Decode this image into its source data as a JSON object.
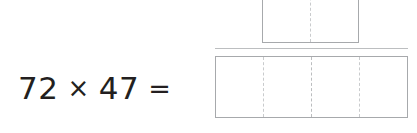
{
  "problem": {
    "first_factor": "72",
    "operator": "×",
    "second_factor": "47",
    "equals": "="
  },
  "answer_rows": [
    {
      "name": "partial-product-row",
      "cells": [
        "",
        ""
      ],
      "cell_count": 2
    },
    {
      "name": "final-answer-row",
      "cells": [
        "",
        "",
        "",
        ""
      ],
      "cell_count": 4
    }
  ],
  "colors": {
    "text": "#231f20",
    "box_border": "#a7a9ac",
    "cell_divider": "#c9cbcd",
    "separator_rule": "#bcbec0",
    "background": "#ffffff"
  }
}
